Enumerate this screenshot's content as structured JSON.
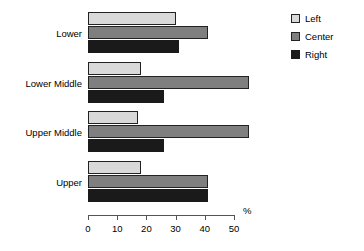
{
  "chart_data": {
    "type": "bar",
    "orientation": "horizontal",
    "title": "",
    "xlabel": "%",
    "ylabel": "",
    "xlim": [
      0,
      50
    ],
    "xticks": [
      0,
      10,
      20,
      30,
      40,
      50
    ],
    "xtick_labels": [
      "0",
      "10",
      "20",
      "30",
      "40",
      "50"
    ],
    "grid": false,
    "legend_position": "right",
    "categories": [
      "Lower",
      "Lower Middle",
      "Upper Middle",
      "Upper"
    ],
    "series": [
      {
        "name": "Left",
        "color": "#d9d9d9",
        "values": [
          30,
          18,
          17,
          18
        ]
      },
      {
        "name": "Center",
        "color": "#7f7f7f",
        "values": [
          41,
          55,
          55,
          41
        ]
      },
      {
        "name": "Right",
        "color": "#1a1a1a",
        "values": [
          31,
          26,
          26,
          41
        ]
      }
    ]
  },
  "axis": {
    "unit_label": "%"
  },
  "legend": {
    "items": [
      {
        "label": "Left",
        "swatch": "legend-swatch-left"
      },
      {
        "label": "Center",
        "swatch": "legend-swatch-center"
      },
      {
        "label": "Right",
        "swatch": "legend-swatch-right"
      }
    ]
  }
}
